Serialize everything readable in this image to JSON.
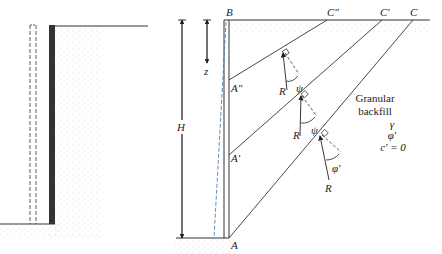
{
  "diagram": {
    "type": "retaining-wall-active-pressure",
    "left_panel": {
      "description": "Wall with backfill; dashed outline shows wall moved away from soil"
    },
    "right_panel": {
      "points": {
        "top_of_wall": "B",
        "base_of_wall": "A",
        "surface_points": [
          "C″",
          "C′",
          "C"
        ],
        "wall_points": [
          "A″",
          "A′"
        ]
      },
      "dimensions": {
        "height": "H",
        "depth": "z"
      },
      "force_labels": [
        "R",
        "R",
        "R"
      ],
      "angle_labels": [
        "ψ",
        "ψ",
        "φ′"
      ],
      "material": {
        "line1": "Granular",
        "line2": "backfill",
        "props": [
          "γ",
          "φ′",
          "c′ = 0"
        ]
      }
    },
    "colors": {
      "ink": "#222222",
      "wall": "#333333",
      "dashed_blue": "#4a7fc1",
      "soil_stipple": "#c8c8c8"
    }
  }
}
